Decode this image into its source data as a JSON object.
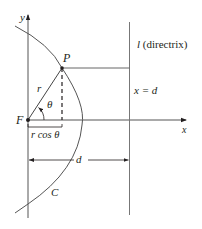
{
  "diagram": {
    "type": "conic-section-polar",
    "labels": {
      "y_axis": "y",
      "x_axis": "x",
      "point": "P",
      "focus": "F",
      "radius": "r",
      "angle": "θ",
      "projection": "r cos θ",
      "distance": "d",
      "curve": "C",
      "directrix_letter": "l",
      "directrix_text": "(directrix)",
      "directrix_equation": "x = d"
    },
    "colors": {
      "line": "#231f20",
      "axis": "#555555",
      "background": "#ffffff"
    }
  }
}
